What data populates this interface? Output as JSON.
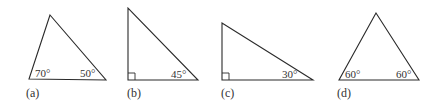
{
  "figure": {
    "triangles": [
      {
        "id": "a",
        "label": "(a)",
        "angles": [
          {
            "position": "bottom-left",
            "text": "70°"
          },
          {
            "position": "bottom-right",
            "text": "50°"
          }
        ],
        "right_angle": false
      },
      {
        "id": "b",
        "label": "(b)",
        "angles": [
          {
            "position": "bottom-right",
            "text": "45°"
          }
        ],
        "right_angle": true
      },
      {
        "id": "c",
        "label": "(c)",
        "angles": [
          {
            "position": "bottom-right",
            "text": "30°"
          }
        ],
        "right_angle": true
      },
      {
        "id": "d",
        "label": "(d)",
        "angles": [
          {
            "position": "bottom-left",
            "text": "60°"
          },
          {
            "position": "bottom-right",
            "text": "60°"
          }
        ],
        "right_angle": false
      }
    ],
    "colors": {
      "stroke": "#2a2a2a",
      "text": "#333333",
      "background": "#ffffff"
    }
  }
}
